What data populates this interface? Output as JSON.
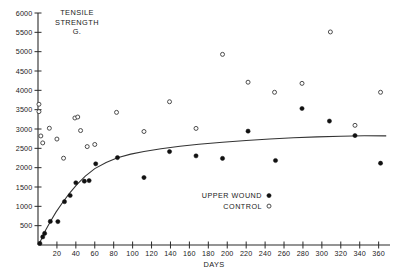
{
  "chart_data": {
    "type": "scatter",
    "title_lines": [
      "TENSILE",
      "STRENGTH",
      "G."
    ],
    "xlabel": "DAYS",
    "ylabel": "",
    "xlim": [
      0,
      372
    ],
    "ylim": [
      0,
      6000
    ],
    "grid": false,
    "xticks": [
      20,
      40,
      60,
      80,
      100,
      120,
      140,
      160,
      180,
      200,
      220,
      240,
      260,
      280,
      300,
      320,
      340,
      360
    ],
    "xtick_labels": [
      "20",
      "40",
      "60",
      "80",
      "100",
      "120",
      "140",
      "160",
      "180",
      "200",
      "220",
      "240",
      "260",
      "280",
      "300",
      "320",
      "340",
      "360"
    ],
    "yticks": [
      500,
      1000,
      1500,
      2000,
      2500,
      3000,
      3500,
      4000,
      4500,
      5000,
      5500,
      6000
    ],
    "ytick_labels": [
      "500",
      "1000",
      "1500",
      "2000",
      "2500",
      "3000",
      "3500",
      "4000",
      "4500",
      "5000",
      "5500",
      "6000"
    ],
    "legend_position": "center-right-inside",
    "series": [
      {
        "name": "UPPER WOUND",
        "marker": "filled-circle",
        "color": "#111111",
        "points": [
          [
            2,
            40
          ],
          [
            5,
            210
          ],
          [
            7,
            300
          ],
          [
            13,
            610
          ],
          [
            21,
            605
          ],
          [
            28,
            1120
          ],
          [
            34,
            1280
          ],
          [
            40,
            1610
          ],
          [
            49,
            1650
          ],
          [
            54,
            1665
          ],
          [
            61,
            2100
          ],
          [
            84,
            2260
          ],
          [
            112,
            1745
          ],
          [
            139,
            2415
          ],
          [
            167,
            2305
          ],
          [
            195,
            2240
          ],
          [
            222,
            2945
          ],
          [
            251,
            2185
          ],
          [
            279,
            3530
          ],
          [
            308,
            3205
          ],
          [
            335,
            2830
          ],
          [
            362,
            2115
          ]
        ]
      },
      {
        "name": "CONTROL",
        "marker": "open-circle",
        "color": "#3a3a3a",
        "points": [
          [
            1,
            3640
          ],
          [
            1,
            3450
          ],
          [
            3,
            2820
          ],
          [
            5,
            2640
          ],
          [
            12,
            3020
          ],
          [
            20,
            2740
          ],
          [
            27,
            2245
          ],
          [
            39,
            3285
          ],
          [
            42,
            3310
          ],
          [
            45,
            2960
          ],
          [
            52,
            2545
          ],
          [
            60,
            2600
          ],
          [
            83,
            3430
          ],
          [
            112,
            2935
          ],
          [
            139,
            3705
          ],
          [
            167,
            3015
          ],
          [
            195,
            4930
          ],
          [
            222,
            4210
          ],
          [
            250,
            3950
          ],
          [
            279,
            4180
          ],
          [
            309,
            5510
          ],
          [
            335,
            3095
          ],
          [
            362,
            3950
          ]
        ]
      }
    ],
    "fit_curve": {
      "name": "fitted-curve",
      "description": "monotonic saturating fit through upper wound points",
      "points": [
        [
          1,
          25
        ],
        [
          4,
          170
        ],
        [
          8,
          380
        ],
        [
          13,
          600
        ],
        [
          19,
          850
        ],
        [
          26,
          1100
        ],
        [
          33,
          1330
        ],
        [
          41,
          1560
        ],
        [
          50,
          1780
        ],
        [
          60,
          1975
        ],
        [
          72,
          2135
        ],
        [
          84,
          2258
        ],
        [
          98,
          2350
        ],
        [
          112,
          2420
        ],
        [
          130,
          2490
        ],
        [
          150,
          2552
        ],
        [
          170,
          2605
        ],
        [
          195,
          2655
        ],
        [
          220,
          2700
        ],
        [
          245,
          2740
        ],
        [
          270,
          2772
        ],
        [
          295,
          2796
        ],
        [
          320,
          2815
        ],
        [
          345,
          2825
        ],
        [
          368,
          2822
        ]
      ]
    }
  },
  "legend": {
    "items": [
      {
        "label": "UPPER WOUND",
        "marker": "filled-circle"
      },
      {
        "label": "CONTROL",
        "marker": "open-circle"
      }
    ]
  }
}
